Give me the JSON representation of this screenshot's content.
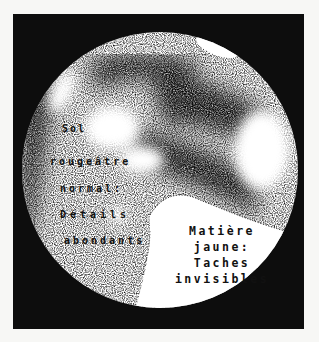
{
  "figure": {
    "colors": {
      "background": "#f7f7f5",
      "frame": "#0d0d0d",
      "light": "#ffffff",
      "dark": "#111111"
    }
  },
  "labels": {
    "left": {
      "line1": "Sol",
      "line2": "rougeâtre",
      "line3": "normal:",
      "line4": "Détails",
      "line5": "abondants"
    },
    "right": {
      "line1": "Matière",
      "line2": "jaune:",
      "line3": "Taches",
      "line4": "invisibles"
    }
  }
}
